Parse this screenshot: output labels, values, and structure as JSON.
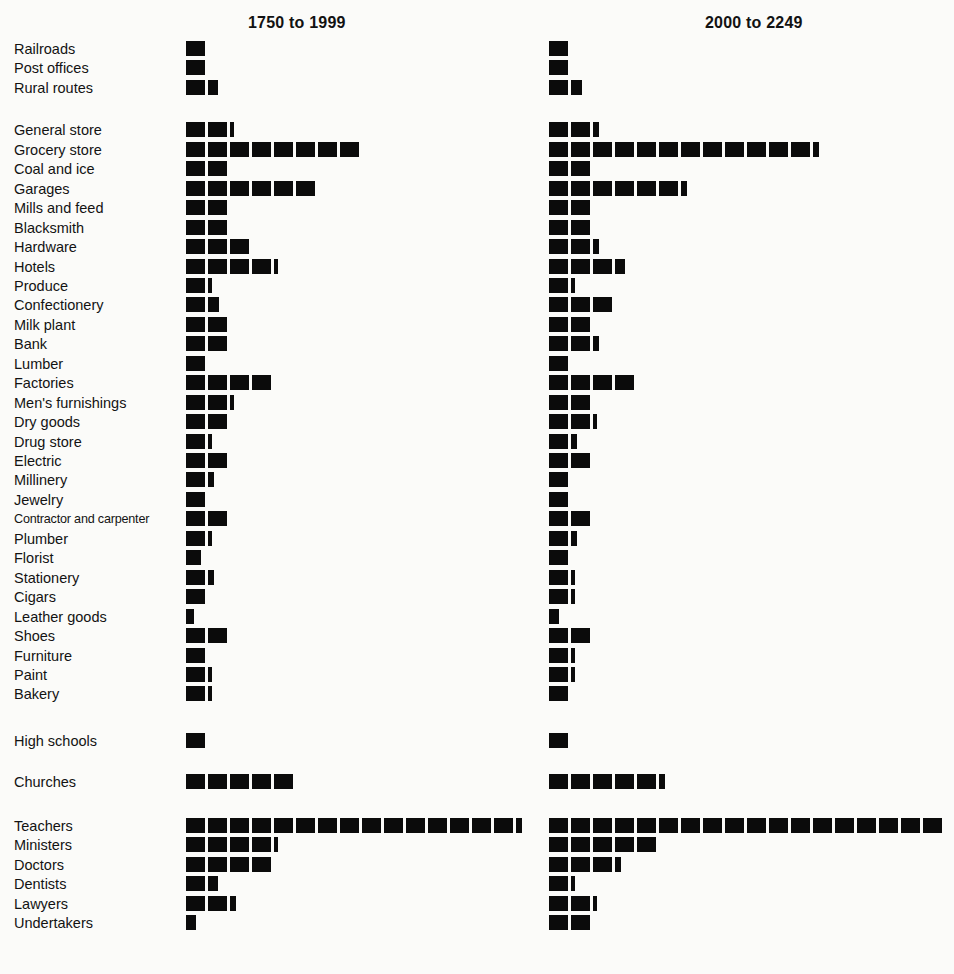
{
  "chart_data": {
    "type": "bar",
    "subtitle": "",
    "xlabel": "",
    "ylabel": "",
    "orientation": "horizontal",
    "units": "blocks (each filled square = one unit)",
    "grid": false,
    "legend_position": "none",
    "panels": [
      {
        "id": "left",
        "label": "1750 to 1999"
      },
      {
        "id": "right",
        "label": "2000 to 2249"
      }
    ],
    "groups": [
      {
        "name": "utilities",
        "categories": [
          "Railroads",
          "Post offices",
          "Rural routes"
        ]
      },
      {
        "name": "businesses",
        "categories": [
          "General store",
          "Grocery store",
          "Coal and ice",
          "Garages",
          "Mills and feed",
          "Blacksmith",
          "Hardware",
          "Hotels",
          "Produce",
          "Confectionery",
          "Milk plant",
          "Bank",
          "Lumber",
          "Factories",
          "Men's furnishings",
          "Dry goods",
          "Drug store",
          "Electric",
          "Millinery",
          "Jewelry",
          "Contractor and carpenter",
          "Plumber",
          "Florist",
          "Stationery",
          "Cigars",
          "Leather goods",
          "Shoes",
          "Furniture",
          "Paint",
          "Bakery"
        ]
      },
      {
        "name": "schools",
        "categories": [
          "High schools"
        ]
      },
      {
        "name": "churches",
        "categories": [
          "Churches"
        ]
      },
      {
        "name": "professions",
        "categories": [
          "Teachers",
          "Ministers",
          "Doctors",
          "Dentists",
          "Lawyers",
          "Undertakers"
        ]
      }
    ],
    "categories": [
      "Railroads",
      "Post offices",
      "Rural routes",
      "General store",
      "Grocery store",
      "Coal and ice",
      "Garages",
      "Mills and feed",
      "Blacksmith",
      "Hardware",
      "Hotels",
      "Produce",
      "Confectionery",
      "Milk plant",
      "Bank",
      "Lumber",
      "Factories",
      "Men's furnishings",
      "Dry goods",
      "Drug store",
      "Electric",
      "Millinery",
      "Jewelry",
      "Contractor and carpenter",
      "Plumber",
      "Florist",
      "Stationery",
      "Cigars",
      "Leather goods",
      "Shoes",
      "Furniture",
      "Paint",
      "Bakery",
      "High schools",
      "Churches",
      "Teachers",
      "Ministers",
      "Doctors",
      "Dentists",
      "Lawyers",
      "Undertakers"
    ],
    "series": [
      {
        "name": "1750 to 1999",
        "values": [
          1,
          1,
          1.5,
          2.2,
          8,
          2,
          6,
          2,
          2,
          3,
          4.2,
          1.2,
          1.6,
          2,
          2,
          1,
          4,
          2.2,
          2,
          1.2,
          2,
          1.3,
          1,
          2,
          1.2,
          0.8,
          1.3,
          1,
          0.4,
          2,
          1,
          1.2,
          1.2,
          1,
          5,
          15.3,
          4.2,
          4,
          1.5,
          2.3,
          0.5
        ]
      },
      {
        "name": "2000 to 2249",
        "values": [
          1,
          1,
          1.6,
          2.3,
          12.3,
          2,
          6.3,
          2,
          2,
          2.3,
          3.5,
          1.2,
          3,
          2,
          2.3,
          1,
          4,
          2,
          2.2,
          1.3,
          2,
          1,
          1,
          2,
          1.3,
          1,
          1.2,
          1.2,
          0.5,
          2,
          1.2,
          1.2,
          1,
          1,
          5.3,
          18,
          5,
          3.3,
          1.2,
          2.2,
          2
        ]
      }
    ]
  },
  "header": {
    "left_title": "1750 to 1999",
    "right_title": "2000 to 2249"
  },
  "labels": [
    "Railroads",
    "Post offices",
    "Rural routes",
    "General store",
    "Grocery store",
    "Coal and ice",
    "Garages",
    "Mills and feed",
    "Blacksmith",
    "Hardware",
    "Hotels",
    "Produce",
    "Confectionery",
    "Milk plant",
    "Bank",
    "Lumber",
    "Factories",
    "Men's furnishings",
    "Dry goods",
    "Drug store",
    "Electric",
    "Millinery",
    "Jewelry",
    "Contractor and carpenter",
    "Plumber",
    "Florist",
    "Stationery",
    "Cigars",
    "Leather goods",
    "Shoes",
    "Furniture",
    "Paint",
    "Bakery",
    "High schools",
    "Churches",
    "Teachers",
    "Ministers",
    "Doctors",
    "Dentists",
    "Lawyers",
    "Undertakers"
  ],
  "style": {
    "block_color": "#0b0b0b",
    "background_color": "#fbfbf9",
    "text_color": "#131313"
  }
}
